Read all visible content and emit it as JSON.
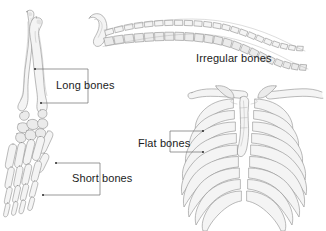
{
  "figure": {
    "background_color": "#ffffff",
    "line_color": "#8d8d8d",
    "fill_color": "#f4f4f4",
    "text_color": "#1c1c1c",
    "leader_color": "#6f6f6f"
  },
  "labels": {
    "long_bones": "Long bones",
    "short_bones": "Short bones",
    "irregular_bones": "Irregular bones",
    "flat_bones": "Flat bones"
  },
  "structures": [
    {
      "name": "forearm-and-hand",
      "icon": "forearm-bones-icon",
      "label": "Long bones",
      "parts": [
        "radius",
        "ulna",
        "carpals",
        "metacarpals",
        "phalanges"
      ]
    },
    {
      "name": "hand-skeleton",
      "icon": "hand-bones-icon",
      "label": "Short bones",
      "parts": [
        "carpals",
        "metacarpals",
        "phalanges"
      ]
    },
    {
      "name": "vertebral-column",
      "icon": "spine-icon",
      "label": "Irregular bones",
      "parts": [
        "cervical",
        "thoracic",
        "lumbar",
        "sacrum",
        "coccyx"
      ]
    },
    {
      "name": "rib-cage",
      "icon": "ribcage-icon",
      "label": "Flat bones",
      "parts": [
        "clavicle",
        "sternum",
        "ribs",
        "costal cartilage"
      ]
    }
  ],
  "leaders": {
    "long_bones": {
      "style": "bracket",
      "opens": "left",
      "points": 2
    },
    "short_bones": {
      "style": "bracket",
      "opens": "left",
      "points": 2
    },
    "flat_bones": {
      "style": "bracket",
      "opens": "right",
      "points": 2
    },
    "irregular_bones": {
      "style": "none",
      "points": 0
    }
  }
}
